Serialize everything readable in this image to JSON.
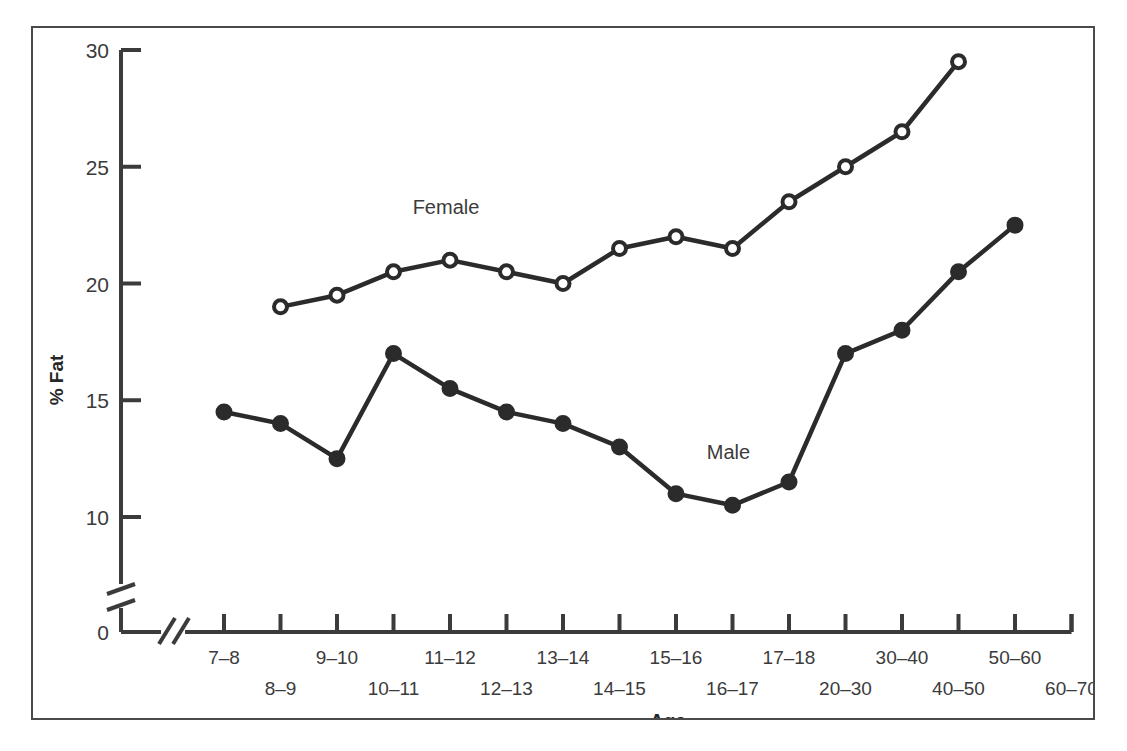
{
  "chart_data": {
    "type": "line",
    "title": "",
    "xlabel": "Age",
    "ylabel": "% Fat",
    "categories": [
      "7–8",
      "8–9",
      "9–10",
      "10–11",
      "11–12",
      "12–13",
      "13–14",
      "14–15",
      "15–16",
      "16–17",
      "17–18",
      "20–30",
      "30–40",
      "40–50",
      "50–60",
      "60–70"
    ],
    "ylim": [
      0,
      30
    ],
    "yticks": [
      0,
      10,
      15,
      20,
      25,
      30
    ],
    "ytick_labels": [
      "0",
      "10",
      "15",
      "20",
      "25",
      "30"
    ],
    "y_axis_break": true,
    "x_axis_break": true,
    "grid": false,
    "legend_position": "inline-annotations",
    "series": [
      {
        "name": "Female",
        "marker": "open-circle",
        "label_x_category": "11–12",
        "values": [
          null,
          19.0,
          19.5,
          20.5,
          21.0,
          20.5,
          20.0,
          21.5,
          22.0,
          21.5,
          23.5,
          25.0,
          26.5,
          29.5,
          null,
          null
        ]
      },
      {
        "name": "Male",
        "marker": "filled-circle",
        "label_x_category": "16–17",
        "values": [
          14.5,
          14.0,
          12.5,
          17.0,
          15.5,
          14.5,
          14.0,
          13.0,
          11.0,
          10.5,
          11.5,
          17.0,
          18.0,
          20.5,
          22.5,
          null
        ]
      }
    ],
    "series_value_map": {
      "Female": [
        {
          "category": "8–9",
          "value": 19.0
        },
        {
          "category": "9–10",
          "value": 19.5
        },
        {
          "category": "10–11",
          "value": 20.5
        },
        {
          "category": "11–12",
          "value": 21.0
        },
        {
          "category": "12–13",
          "value": 20.5
        },
        {
          "category": "13–14",
          "value": 20.0
        },
        {
          "category": "14–15",
          "value": 21.5
        },
        {
          "category": "15–16",
          "value": 22.0
        },
        {
          "category": "17–18",
          "value": 21.5
        },
        {
          "category": "20–30",
          "value": 23.5
        },
        {
          "category": "30–40",
          "value": 25.0
        },
        {
          "category": "40–50",
          "value": 26.5
        },
        {
          "category": "50–60",
          "value": 29.5
        }
      ],
      "Male": [
        {
          "category": "7–8",
          "value": 14.5
        },
        {
          "category": "8–9",
          "value": 14.0
        },
        {
          "category": "9–10",
          "value": 12.5
        },
        {
          "category": "10–11",
          "value": 17.0
        },
        {
          "category": "11–12",
          "value": 15.5
        },
        {
          "category": "12–13",
          "value": 14.5
        },
        {
          "category": "13–14",
          "value": 14.0
        },
        {
          "category": "14–15",
          "value": 13.0
        },
        {
          "category": "15–16",
          "value": 11.0
        },
        {
          "category": "16–17",
          "value": 10.5
        },
        {
          "category": "17–18",
          "value": 11.5
        },
        {
          "category": "20–30",
          "value": 17.0
        },
        {
          "category": "30–40",
          "value": 18.0
        },
        {
          "category": "40–50",
          "value": 20.5
        },
        {
          "category": "50–60",
          "value": 22.5
        },
        {
          "category": "60–70",
          "value": 22.5
        }
      ]
    },
    "colors": {
      "line": "#2b2b2b",
      "axis": "#3b3b3b",
      "text": "#3b3b3b",
      "frame": "#4a4a4a",
      "background": "#ffffff",
      "open_marker_fill": "#ffffff"
    }
  }
}
